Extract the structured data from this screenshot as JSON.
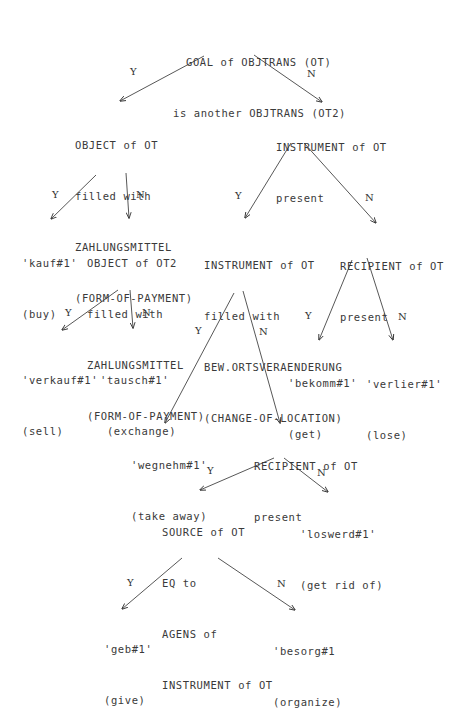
{
  "diagram": {
    "type": "decision-tree",
    "nodes": {
      "root": {
        "lines": [
          "GOAL of OBJTRANS (OT)",
          "is another OBJTRANS (OT2)"
        ]
      },
      "object_ot": {
        "lines": [
          "OBJECT of OT",
          "filled with",
          "ZAHLUNGSMITTEL",
          "(FORM-OF-PAYMENT)"
        ]
      },
      "instrument_present": {
        "lines": [
          "INSTRUMENT of OT",
          "present"
        ]
      },
      "kauf": {
        "lines": [
          "'kauf#1'",
          "(buy)"
        ]
      },
      "object_ot2": {
        "lines": [
          "OBJECT of OT2",
          "filled with",
          "ZAHLUNGSMITTEL",
          "(FORM-OF-PAYMENT)"
        ]
      },
      "instrument_filled": {
        "lines": [
          "INSTRUMENT of OT",
          "filled with",
          "BEW.ORTSVERAENDERUNG",
          "(CHANGE-OF-LOCATION)"
        ]
      },
      "recipient_present_1": {
        "lines": [
          "RECIPIENT of OT",
          "present"
        ]
      },
      "verkauf": {
        "lines": [
          "'verkauf#1'",
          "(sell)"
        ]
      },
      "tausch": {
        "lines": [
          "'tausch#1'",
          " (exchange)"
        ]
      },
      "bekomm": {
        "lines": [
          "'bekomm#1'",
          "(get)"
        ]
      },
      "verlier": {
        "lines": [
          "'verlier#1'",
          "(lose)"
        ]
      },
      "wegnehm": {
        "lines": [
          "'wegnehm#1'",
          "(take away)"
        ]
      },
      "recipient_present_2": {
        "lines": [
          "RECIPIENT of OT",
          "present"
        ]
      },
      "source_eq": {
        "lines": [
          "SOURCE of OT",
          "EQ to",
          "AGENS of",
          "INSTRUMENT of OT"
        ]
      },
      "loswerd": {
        "lines": [
          "'loswerd#1'",
          "(get rid of)"
        ]
      },
      "geb": {
        "lines": [
          "'geb#1'",
          "(give)"
        ]
      },
      "besorg": {
        "lines": [
          "'besorg#1",
          "(organize)"
        ]
      }
    },
    "edge_labels": {
      "yes": "Y",
      "no": "N"
    },
    "edges": [
      {
        "from": "root",
        "to": "object_ot",
        "label": "Y"
      },
      {
        "from": "root",
        "to": "instrument_present",
        "label": "N"
      },
      {
        "from": "object_ot",
        "to": "kauf",
        "label": "Y"
      },
      {
        "from": "object_ot",
        "to": "object_ot2",
        "label": "N"
      },
      {
        "from": "instrument_present",
        "to": "instrument_filled",
        "label": "Y"
      },
      {
        "from": "instrument_present",
        "to": "recipient_present_1",
        "label": "N"
      },
      {
        "from": "object_ot2",
        "to": "verkauf",
        "label": "Y"
      },
      {
        "from": "object_ot2",
        "to": "tausch",
        "label": "N"
      },
      {
        "from": "instrument_filled",
        "to": "wegnehm",
        "label": "Y"
      },
      {
        "from": "instrument_filled",
        "to": "recipient_present_2",
        "label": "N"
      },
      {
        "from": "recipient_present_1",
        "to": "bekomm",
        "label": "Y"
      },
      {
        "from": "recipient_present_1",
        "to": "verlier",
        "label": "N"
      },
      {
        "from": "recipient_present_2",
        "to": "source_eq",
        "label": "Y"
      },
      {
        "from": "recipient_present_2",
        "to": "loswerd",
        "label": "N"
      },
      {
        "from": "source_eq",
        "to": "geb",
        "label": "Y"
      },
      {
        "from": "source_eq",
        "to": "besorg",
        "label": "N"
      }
    ],
    "colors": {
      "text": "#3a3a3a",
      "line": "#444444",
      "background": "#ffffff"
    }
  }
}
